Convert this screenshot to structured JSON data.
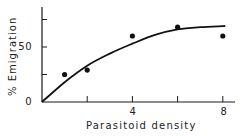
{
  "chart_data": {
    "type": "scatter",
    "title": "",
    "xlabel": "Parasitoid density",
    "ylabel": "% Emigration",
    "xlim": [
      0,
      8.5
    ],
    "ylim": [
      0,
      85
    ],
    "x_ticks": [
      0,
      2,
      4,
      6,
      8
    ],
    "x_tick_labels": [
      "",
      "",
      "4",
      "",
      "8"
    ],
    "y_ticks": [
      0,
      25,
      50,
      75
    ],
    "y_tick_labels": [
      "0",
      "",
      "50",
      ""
    ],
    "grid": false,
    "legend": null,
    "series": [
      {
        "name": "Observed",
        "type": "scatter",
        "marker": "filled-circle",
        "x": [
          1,
          2,
          4,
          6,
          8
        ],
        "y": [
          25,
          29,
          60,
          68,
          60
        ]
      },
      {
        "name": "Fitted curve",
        "type": "line",
        "x": [
          0,
          1,
          2,
          3,
          4,
          5,
          6,
          7,
          8,
          8.1
        ],
        "y": [
          0,
          18,
          33,
          44,
          53,
          61,
          66,
          68,
          69,
          69
        ]
      }
    ]
  },
  "labels": {
    "y_axis": "% Emigration",
    "x_axis": "Parasitoid density",
    "y_tick_0": "0",
    "y_tick_50": "50",
    "x_tick_4": "4",
    "x_tick_8": "8"
  },
  "colors": {
    "ink": "#111111",
    "background": "#ffffff"
  }
}
